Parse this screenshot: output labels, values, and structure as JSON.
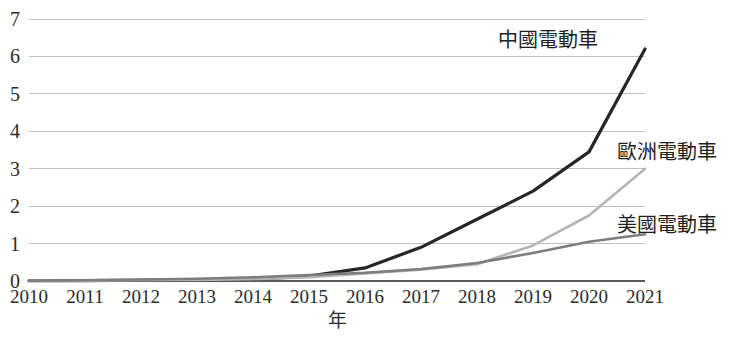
{
  "chart_data": {
    "type": "line",
    "title": "",
    "subtitle": "",
    "xlabel": "年",
    "ylabel": "",
    "x": [
      "2010",
      "2011",
      "2012",
      "2013",
      "2014",
      "2015",
      "2016",
      "2017",
      "2018",
      "2019",
      "2020",
      "2021"
    ],
    "categories": [
      "2010",
      "2011",
      "2012",
      "2013",
      "2014",
      "2015",
      "2016",
      "2017",
      "2018",
      "2019",
      "2020",
      "2021"
    ],
    "xlim": [
      2010,
      2021
    ],
    "ylim": [
      0,
      7
    ],
    "yticks": [
      "0",
      "1",
      "2",
      "3",
      "4",
      "5",
      "6",
      "7"
    ],
    "grid": "horizontal",
    "legend_position": "inline-end-labels",
    "series": [
      {
        "name": "中國電動車",
        "color": "#262626",
        "width": 3.2,
        "values": [
          0.01,
          0.01,
          0.02,
          0.03,
          0.05,
          0.13,
          0.35,
          0.9,
          1.65,
          2.4,
          3.45,
          6.2
        ]
      },
      {
        "name": "歐洲電動車",
        "color": "#b4b4b4",
        "width": 2.6,
        "values": [
          0.01,
          0.01,
          0.02,
          0.03,
          0.05,
          0.1,
          0.2,
          0.3,
          0.45,
          0.95,
          1.75,
          3.0
        ]
      },
      {
        "name": "美國電動車",
        "color": "#7d7d7d",
        "width": 2.6,
        "values": [
          0.01,
          0.02,
          0.04,
          0.06,
          0.1,
          0.16,
          0.22,
          0.32,
          0.48,
          0.75,
          1.05,
          1.25
        ]
      }
    ]
  },
  "axes": {
    "y_ticks": [
      "7",
      "6",
      "5",
      "4",
      "3",
      "2",
      "1",
      "0"
    ],
    "x_ticks": [
      "2010",
      "2011",
      "2012",
      "2013",
      "2014",
      "2015",
      "2016",
      "2017",
      "2018",
      "2019",
      "2020",
      "2021"
    ],
    "x_axis_title": "年"
  },
  "series_labels": [
    {
      "text": "中國電動車",
      "x": 498,
      "y": 47
    },
    {
      "text": "歐洲電動車",
      "x": 617,
      "y": 159
    },
    {
      "text": "美國電動車",
      "x": 617,
      "y": 232
    }
  ],
  "colors": {
    "china_line": "#262626",
    "europe_line": "#b4b4b4",
    "usa_line": "#7d7d7d",
    "gridline": "#bfbfbf",
    "axis": "#595959",
    "background": "#ffffff",
    "text": "#2b2b2b"
  },
  "geometry": {
    "plot_left": 29,
    "plot_right": 645,
    "plot_top": 19,
    "plot_bottom": 281
  }
}
